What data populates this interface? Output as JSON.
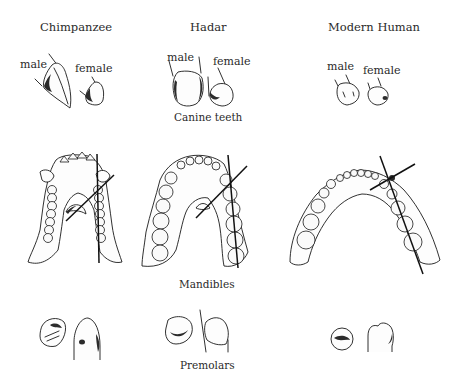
{
  "columns": [
    {
      "title": "Chimpanzee",
      "male_label": "male",
      "female_label": "female"
    },
    {
      "title": "Hadar",
      "male_label": "male",
      "female_label": "female"
    },
    {
      "title": "Modern Human",
      "male_label": "male",
      "female_label": "female"
    }
  ],
  "row_labels": {
    "canines": "Canine teeth",
    "mandibles": "Mandibles",
    "premolars": "Premolars"
  }
}
